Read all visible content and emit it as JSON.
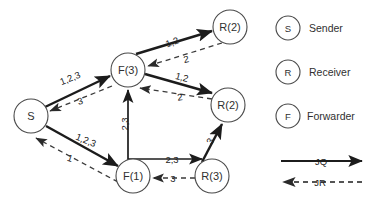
{
  "diagram": {
    "type": "directed-graph",
    "nodes": [
      {
        "id": "S",
        "label": "S",
        "cx": 31,
        "cy": 116,
        "r": 17
      },
      {
        "id": "F3",
        "label": "F(3)",
        "cx": 128,
        "cy": 70,
        "r": 17
      },
      {
        "id": "F1",
        "label": "F(1)",
        "cx": 133,
        "cy": 176,
        "r": 17
      },
      {
        "id": "R3",
        "label": "R(3)",
        "cx": 212,
        "cy": 176,
        "r": 17
      },
      {
        "id": "R2top",
        "label": "R(2)",
        "cx": 230,
        "cy": 27,
        "r": 17
      },
      {
        "id": "R2mid",
        "label": "R(2)",
        "cx": 228,
        "cy": 105,
        "r": 17
      }
    ],
    "edges": [
      {
        "from": "S",
        "to": "F3",
        "style": "solid",
        "label": "1,2,3",
        "label_x": 70,
        "label_y": 78,
        "label_rot": -22
      },
      {
        "from": "F3",
        "to": "S",
        "style": "dashed",
        "label": "3",
        "label_x": 80,
        "label_y": 101,
        "label_rot": -16
      },
      {
        "from": "S",
        "to": "F1",
        "style": "solid",
        "label": "1,2,3",
        "label_x": 86,
        "label_y": 140,
        "label_rot": 22
      },
      {
        "from": "F1",
        "to": "S",
        "style": "dashed",
        "label": "1",
        "label_x": 70,
        "label_y": 158,
        "label_rot": 18
      },
      {
        "from": "F1",
        "to": "F3",
        "style": "solid",
        "label": "2,3",
        "label_x": 124,
        "label_y": 124,
        "label_rot": -90
      },
      {
        "from": "R2mid",
        "to": "F3",
        "style": "dashed",
        "label": "2",
        "label_x": 180,
        "label_y": 97,
        "label_rot": -8
      },
      {
        "from": "F3",
        "to": "R2top",
        "style": "solid",
        "label": "1,2",
        "label_x": 172,
        "label_y": 42,
        "label_rot": -20
      },
      {
        "from": "R2top",
        "to": "F3",
        "style": "dashed",
        "label": "2",
        "label_x": 186,
        "label_y": 59,
        "label_rot": -12
      },
      {
        "from": "F3",
        "to": "R2mid",
        "style": "solid",
        "label": "1,2",
        "label_x": 182,
        "label_y": 77,
        "label_rot": 15
      },
      {
        "from": "F1",
        "to": "R3",
        "style": "solid",
        "label": "2,3",
        "label_x": 172,
        "label_y": 159,
        "label_rot": 0
      },
      {
        "from": "R3",
        "to": "F1",
        "style": "dashed",
        "label": "3",
        "label_x": 173,
        "label_y": 178,
        "label_rot": 0
      },
      {
        "from": "R3",
        "to": "R2mid",
        "style": "solid",
        "label": "3",
        "label_x": 213,
        "label_y": 142,
        "label_rot": -60
      }
    ]
  },
  "legend": {
    "nodes": [
      {
        "symbol": "S",
        "text": "Sender"
      },
      {
        "symbol": "R",
        "text": "Receiver"
      },
      {
        "symbol": "F",
        "text": "Forwarder"
      }
    ],
    "lines": [
      {
        "label": "JQ",
        "style": "solid"
      },
      {
        "label": "JR",
        "style": "dashed"
      }
    ]
  }
}
